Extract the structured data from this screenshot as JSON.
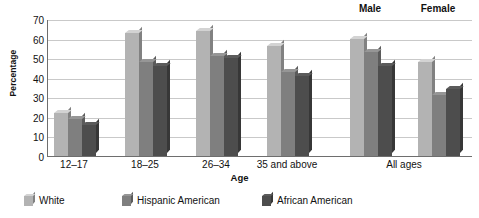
{
  "chart_data": {
    "type": "bar",
    "title": "",
    "xlabel": "Age",
    "ylabel": "Percentage",
    "ylim": [
      0,
      70
    ],
    "yticks": [
      0,
      10,
      20,
      30,
      40,
      50,
      60,
      70
    ],
    "grid": true,
    "legend_position": "bottom-left",
    "categories": [
      "12–17",
      "18–25",
      "26–34",
      "35 and above",
      "Male",
      "Female"
    ],
    "group_annotations": [
      {
        "label": "Male",
        "applies_to": "Male"
      },
      {
        "label": "Female",
        "applies_to": "Female"
      }
    ],
    "x_tick_labels": [
      "12–17",
      "18–25",
      "26–34",
      "35 and above",
      "All ages"
    ],
    "series": [
      {
        "name": "White",
        "color": "#b3b3b3",
        "values": [
          22,
          63,
          64,
          56,
          60,
          48
        ]
      },
      {
        "name": "Hispanic American",
        "color": "#7f7f7f",
        "values": [
          19,
          48,
          51,
          43,
          53,
          31
        ]
      },
      {
        "name": "African American",
        "color": "#4d4d4d",
        "values": [
          16,
          46,
          50,
          41,
          46,
          34
        ]
      }
    ]
  },
  "axis": {
    "y_title": "Percentage",
    "x_title": "Age",
    "y_tick_labels": [
      "70",
      "60",
      "50",
      "40",
      "30",
      "20",
      "10",
      "0"
    ],
    "x_tick_labels": [
      "12–17",
      "18–25",
      "26–34",
      "35 and above",
      "All ages"
    ]
  },
  "annotations": {
    "male": "Male",
    "female": "Female"
  },
  "legend": {
    "items": [
      {
        "label": "White",
        "color": "#b3b3b3"
      },
      {
        "label": "Hispanic American",
        "color": "#7f7f7f"
      },
      {
        "label": "African American",
        "color": "#4d4d4d"
      }
    ]
  }
}
